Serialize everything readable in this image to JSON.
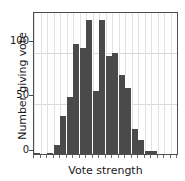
{
  "chart_data": {
    "type": "bar",
    "title": "",
    "subtitle": "",
    "xlabel": "Vote strength",
    "ylabel": "Number giving vote",
    "ylim": [
      0,
      140
    ],
    "yticks": [
      0,
      50,
      100
    ],
    "ytick_labels": [
      "0",
      "50",
      "100"
    ],
    "xticks_labeled": false,
    "grid": true,
    "legend": null,
    "bar_color": "#4a4a4a",
    "n_bins": 22,
    "categories": [
      "bin1",
      "bin2",
      "bin3",
      "bin4",
      "bin5",
      "bin6",
      "bin7",
      "bin8",
      "bin9",
      "bin10",
      "bin11",
      "bin12",
      "bin13",
      "bin14",
      "bin15",
      "bin16",
      "bin17",
      "bin18",
      "bin19",
      "bin20",
      "bin21",
      "bin22"
    ],
    "values": [
      1,
      0,
      1,
      9,
      38,
      57,
      109,
      105,
      133,
      63,
      133,
      97,
      100,
      78,
      66,
      25,
      14,
      3,
      3,
      0,
      0,
      0
    ]
  },
  "axes": {
    "y_title": "Number giving vote",
    "x_title": "Vote strength",
    "y_tick_0": "0",
    "y_tick_50": "50",
    "y_tick_100": "100"
  }
}
